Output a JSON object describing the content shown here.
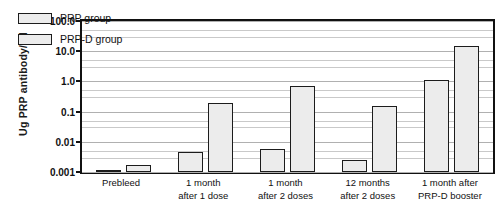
{
  "chart_data": {
    "type": "bar",
    "title": "",
    "xlabel": "",
    "ylabel": "Ug PRP antibody/ml",
    "yscale": "log",
    "ylim": [
      0.001,
      100.0
    ],
    "ytick_labels": [
      "100.0",
      "10.0",
      "1.0",
      "0.1",
      "0.01",
      "0.001"
    ],
    "ytick_values": [
      100.0,
      10.0,
      1.0,
      0.1,
      0.01,
      0.001
    ],
    "grid": true,
    "legend_position": "top-left",
    "categories": [
      "Prebleed",
      "1 month after 1 dose",
      "1 month after 2 doses",
      "12 months after 2 doses",
      "1 month after PRP-D booster"
    ],
    "category_lines": [
      [
        "Prebleed",
        ""
      ],
      [
        "1 month",
        "after 1 dose"
      ],
      [
        "1 month",
        "after 2 doses"
      ],
      [
        "12 months",
        "after 2 doses"
      ],
      [
        "1 month after",
        "PRP-D booster"
      ]
    ],
    "series": [
      {
        "name": "PRP group",
        "values": [
          0.0012,
          0.0045,
          0.006,
          0.0025,
          1.1
        ]
      },
      {
        "name": "PRP-D group",
        "values": [
          0.0017,
          0.2,
          0.7,
          0.15,
          15.0
        ]
      }
    ],
    "colors": {
      "bar_fill": "#ececec",
      "bar_border": "#1c1c1c",
      "grid": "#c9c9c9",
      "axis": "#111111",
      "background": "#ffffff"
    }
  },
  "legend": {
    "items": [
      {
        "label": "PRP group"
      },
      {
        "label": "PRP-D group"
      }
    ]
  }
}
